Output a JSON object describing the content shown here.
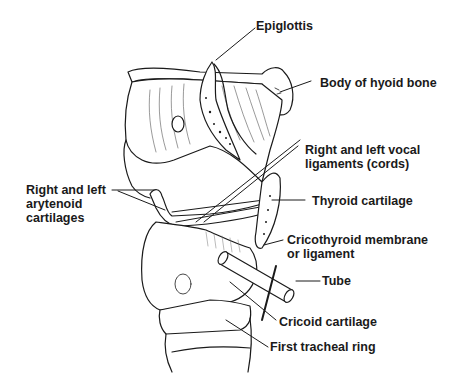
{
  "figure": {
    "labels": {
      "epiglottis": [
        "Epiglottis"
      ],
      "hyoid": [
        "Body of hyoid bone"
      ],
      "vocal": [
        "Right and left vocal",
        "ligaments (cords)"
      ],
      "thyroid": [
        "Thyroid cartilage"
      ],
      "arytenoid": [
        "Right and left",
        "arytenoid",
        "cartilages"
      ],
      "cricothyroid": [
        "Cricothyroid membrane",
        "or ligament"
      ],
      "tube": [
        "Tube"
      ],
      "cricoid": [
        "Cricoid cartilage"
      ],
      "tracheal": [
        "First tracheal ring"
      ]
    },
    "colors": {
      "ink": "#1a1a1a",
      "background": "#ffffff",
      "shade": "#c8c8c8"
    }
  }
}
